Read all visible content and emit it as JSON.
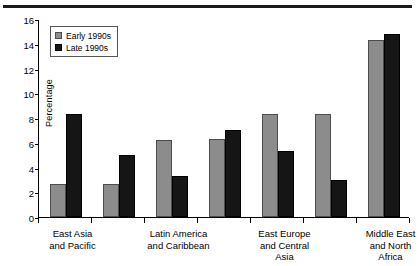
{
  "colors": {
    "early": "#8c8c8c",
    "late": "#151515",
    "axis": "#000000",
    "top_rule": "#1a1a1a",
    "background": "#ffffff"
  },
  "legend": {
    "position": "top-left-inside",
    "entries": [
      {
        "label": "Early 1990s",
        "swatch": "early"
      },
      {
        "label": "Late 1990s",
        "swatch": "late"
      }
    ]
  },
  "axis": {
    "ylabel": "Percentage",
    "yticks": [
      "0",
      "2",
      "4",
      "6",
      "8",
      "10",
      "12",
      "14",
      "16"
    ],
    "ymin": 0,
    "ymax": 16,
    "ystep": 2
  },
  "xlabels": [
    {
      "line1": "East Asia",
      "line2": "and Pacific",
      "line3": ""
    },
    {
      "line1": "Latin America",
      "line2": "and Caribbean",
      "line3": ""
    },
    {
      "line1": "East Europe",
      "line2": "and Central",
      "line3": "Asia"
    },
    {
      "line1": "Middle East",
      "line2": "and North",
      "line3": "Africa"
    }
  ],
  "chart_data": {
    "type": "bar",
    "title": "",
    "subtitle": "",
    "xlabel": "",
    "ylabel": "Percentage",
    "ylim": [
      0,
      16
    ],
    "ytick_step": 2,
    "grid": false,
    "legend_position": "upper left",
    "categories": [
      "East Asia and Pacific",
      "",
      "Latin America and Caribbean",
      "",
      "East Europe and Central Asia",
      "",
      "Middle East and North Africa"
    ],
    "series": [
      {
        "name": "Early 1990s",
        "color": "#8c8c8c",
        "values": [
          2.7,
          2.7,
          6.2,
          6.3,
          8.3,
          8.3,
          14.3
        ]
      },
      {
        "name": "Late 1990s",
        "color": "#151515",
        "values": [
          8.3,
          5.0,
          3.3,
          7.0,
          5.3,
          3.0,
          14.8
        ]
      }
    ],
    "labeled_group_indices": [
      0,
      2,
      4,
      6
    ],
    "group_count": 7
  }
}
